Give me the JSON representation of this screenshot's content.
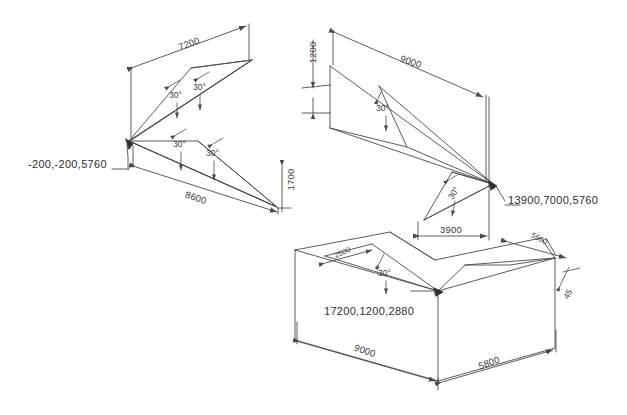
{
  "drawing": {
    "title": "Isometric roof framing dimension drawing",
    "type": "technical-line-drawing",
    "stroke_color": "#4a4a4a",
    "text_color": "#3a3a3a",
    "background": "#ffffff",
    "width": 627,
    "height": 415
  },
  "coordinates": [
    {
      "id": "left-apex",
      "text": "-200,-200,5760",
      "x": 28,
      "y": 165
    },
    {
      "id": "right-apex",
      "text": "13900,7000,5760",
      "x": 508,
      "y": 201
    },
    {
      "id": "bottom-apex",
      "text": "17200,1200,2880",
      "x": 324,
      "y": 312
    }
  ],
  "dimensions": [
    {
      "id": "dim-7200",
      "text": "7200",
      "x": 178,
      "y": 44,
      "rot": -19
    },
    {
      "id": "dim-8600",
      "text": "8600",
      "x": 185,
      "y": 198,
      "rot": 19
    },
    {
      "id": "dim-1700",
      "text": "1700",
      "x": 287,
      "y": 180,
      "rot": -90
    },
    {
      "id": "dim-1200",
      "text": "1200",
      "x": 309,
      "y": 53,
      "rot": -90
    },
    {
      "id": "dim-9000t",
      "text": "9000",
      "x": 406,
      "y": 62,
      "rot": 19
    },
    {
      "id": "dim-3900",
      "text": "3900",
      "x": 444,
      "y": 230,
      "rot": 0
    },
    {
      "id": "dim-2500",
      "text": "2500",
      "x": 340,
      "y": 254,
      "rot": -24
    },
    {
      "id": "dim-5500",
      "text": "5500",
      "x": 537,
      "y": 240,
      "rot": 28
    },
    {
      "id": "dim-9000b",
      "text": "9000",
      "x": 360,
      "y": 351,
      "rot": 19
    },
    {
      "id": "dim-5800",
      "text": "5800",
      "x": 484,
      "y": 363,
      "rot": -19
    }
  ],
  "angles": [
    {
      "id": "ang-1",
      "text": "30°",
      "x": 172,
      "y": 94,
      "rot": 0
    },
    {
      "id": "ang-2",
      "text": "30°",
      "x": 196,
      "y": 86,
      "rot": 0
    },
    {
      "id": "ang-3",
      "text": "30°",
      "x": 176,
      "y": 143,
      "rot": 0
    },
    {
      "id": "ang-4",
      "text": "30°",
      "x": 209,
      "y": 152,
      "rot": 0
    },
    {
      "id": "ang-5",
      "text": "30°",
      "x": 379,
      "y": 107,
      "rot": 0
    },
    {
      "id": "ang-6",
      "text": "30°",
      "x": 452,
      "y": 192,
      "rot": -60
    },
    {
      "id": "ang-7",
      "text": "30°",
      "x": 381,
      "y": 272,
      "rot": 0
    },
    {
      "id": "ang-8",
      "text": "45",
      "x": 566,
      "y": 293,
      "rot": -60
    }
  ]
}
